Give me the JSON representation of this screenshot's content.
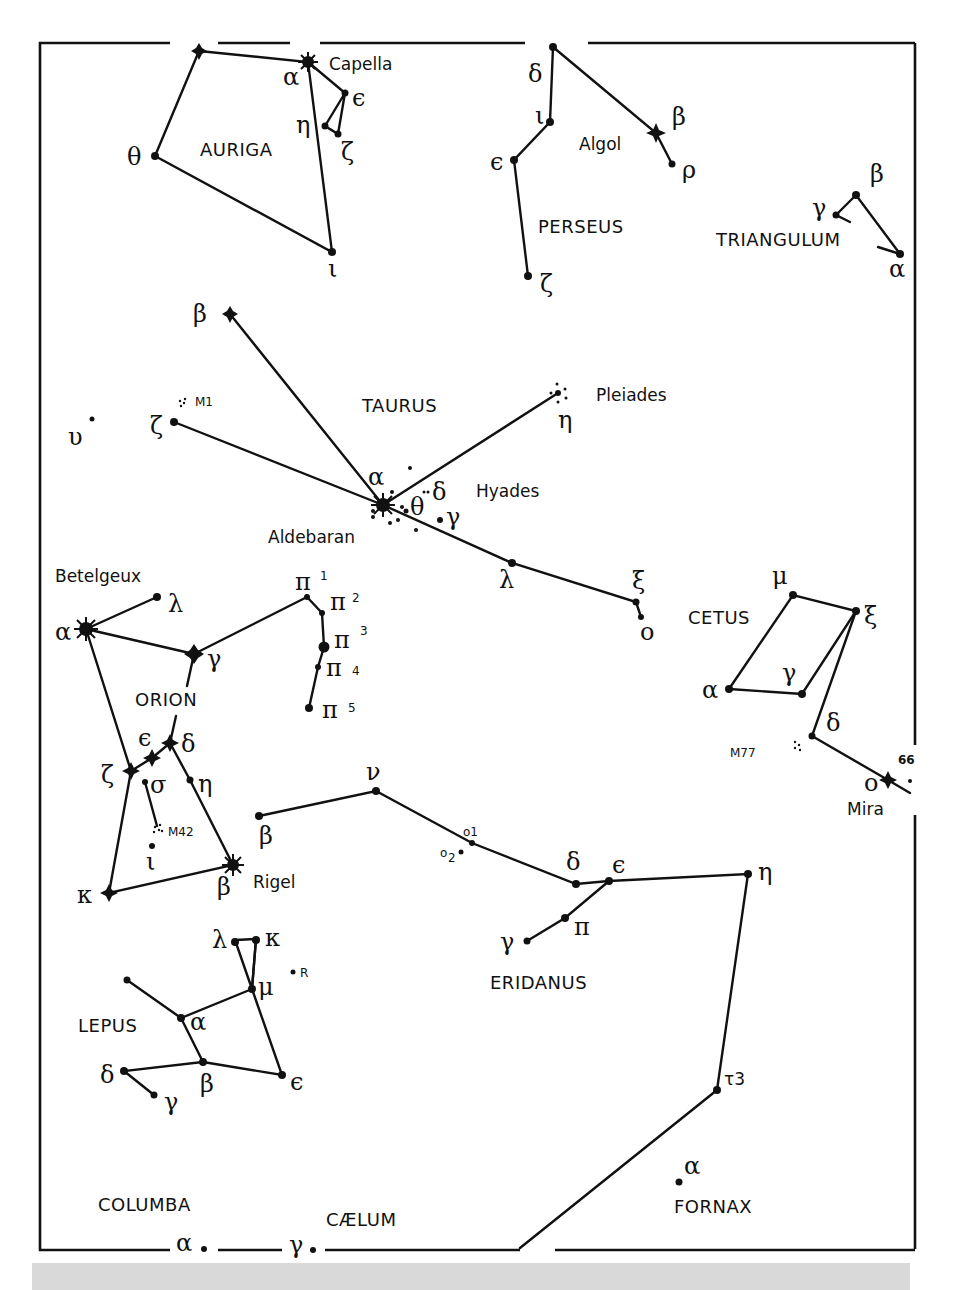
{
  "figure": {
    "type": "star-chart",
    "region": "Winter sky: Auriga, Perseus, Taurus, Orion, Eridanus, Cetus, Lepus"
  },
  "constellations": {
    "auriga": "AURIGA",
    "perseus": "PERSEUS",
    "triangulum": "TRIANGULUM",
    "taurus": "TAURUS",
    "cetus": "CETUS",
    "orion": "ORION",
    "eridanus": "ERIDANUS",
    "lepus": "LEPUS",
    "columba": "COLUMBA",
    "caelum": "CÆLUM",
    "fornax": "FORNAX"
  },
  "proper_names": {
    "capella": "Capella",
    "algol": "Algol",
    "pleiades": "Pleiades",
    "hyades": "Hyades",
    "aldebaran": "Aldebaran",
    "betelgeux": "Betelgeux",
    "rigel": "Rigel",
    "mira": "Mira",
    "m1": "M1",
    "m42": "M42",
    "m77": "M77",
    "r": "R"
  },
  "greek": {
    "auriga": {
      "alpha": "α",
      "eta": "η",
      "epsilon": "ϵ",
      "zeta": "ζ",
      "theta": "θ",
      "iota": "ι"
    },
    "perseus": {
      "delta": "δ",
      "iota": "ι",
      "epsilon": "ϵ",
      "beta": "β",
      "rho": "ρ",
      "zeta": "ζ"
    },
    "triangulum": {
      "beta": "β",
      "gamma": "γ",
      "alpha": "α"
    },
    "taurus": {
      "beta": "β",
      "zeta": "ζ",
      "upsilon": "υ",
      "alpha": "α",
      "delta": "δ",
      "theta": "θ",
      "gamma": "γ",
      "eta": "η",
      "lambda": "λ",
      "xi": "ξ",
      "omicron": "ο"
    },
    "orion": {
      "alpha": "α",
      "lambda": "λ",
      "gamma": "γ",
      "pi1": "π",
      "pi1_sup": "1",
      "pi2": "π",
      "pi2_sup": "2",
      "pi3": "π",
      "pi3_sup": "3",
      "pi4": "π",
      "pi4_sup": "4",
      "pi5": "π",
      "pi5_sup": "5",
      "epsilon": "ϵ",
      "delta": "δ",
      "zeta": "ζ",
      "sigma": "σ",
      "eta": "η",
      "iota": "ι",
      "kappa": "κ",
      "beta": "β"
    },
    "cetus": {
      "mu": "μ",
      "xi": "ξ",
      "gamma": "γ",
      "alpha": "α",
      "delta": "δ",
      "omicron": "ο",
      "sixty_six": "66"
    },
    "eridanus": {
      "beta": "β",
      "nu": "ν",
      "o1": "o1",
      "o2": "o",
      "o2_sub": "2",
      "delta": "δ",
      "epsilon": "ϵ",
      "eta": "η",
      "pi": "π",
      "gamma": "γ",
      "tau3": "τ3"
    },
    "lepus": {
      "lambda": "λ",
      "kappa": "κ",
      "mu": "μ",
      "alpha": "α",
      "delta": "δ",
      "beta": "β",
      "gamma": "γ",
      "epsilon": "ϵ"
    },
    "columba": {
      "alpha": "α"
    },
    "caelum": {
      "gamma": "γ"
    },
    "fornax": {
      "alpha": "α"
    }
  }
}
